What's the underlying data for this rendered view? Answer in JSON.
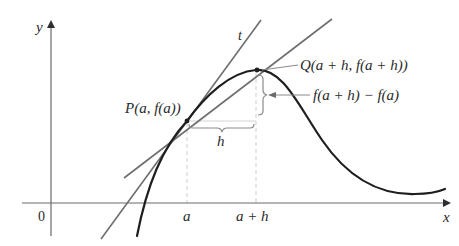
{
  "diagram": {
    "type": "secant-tangent-derivative-illustration",
    "axes": {
      "x_label": "x",
      "y_label": "y",
      "origin_label": "0"
    },
    "tick_labels": {
      "a": "a",
      "a_plus_h": "a + h"
    },
    "points": {
      "P": {
        "label": "P(a, f(a))"
      },
      "Q": {
        "label": "Q(a + h, f(a + h))"
      }
    },
    "lines": {
      "tangent": {
        "label": "t"
      },
      "secant": {
        "label": ""
      }
    },
    "annotations": {
      "h": "h",
      "rise": "f(a + h) − f(a)"
    },
    "colors": {
      "curve": "#1e1e1e",
      "lines": "#6e6e6e",
      "axes": "#6a6a6a",
      "guides": "#c8c8c8",
      "text": "#2a2a2a"
    }
  }
}
